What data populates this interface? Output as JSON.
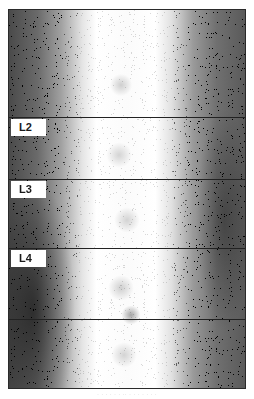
{
  "image": {
    "description": "Grayscale stippled spinal scan with vertebral level labels",
    "labels": [
      {
        "text": "L2",
        "top": 109
      },
      {
        "text": "L3",
        "top": 171
      },
      {
        "text": "L4",
        "top": 240
      }
    ],
    "dividers_y": [
      107,
      169,
      238,
      309
    ],
    "caption": "· · ·  ·  ·  · ·· ·  ·  ·  · · · ·"
  }
}
